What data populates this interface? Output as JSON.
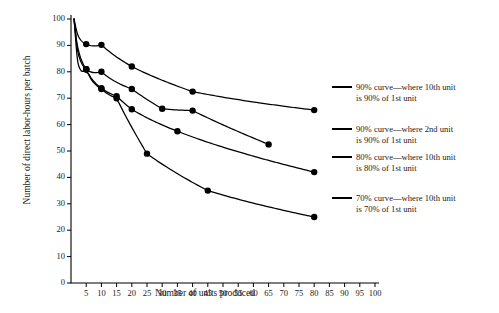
{
  "chart_data": {
    "type": "line",
    "title": "",
    "xlabel": "Number of units produced",
    "ylabel": "Number of direct labor-hours per batch",
    "xlim": [
      0,
      100
    ],
    "ylim": [
      0,
      100
    ],
    "grid": false,
    "legend_position": "right",
    "x_ticks": [
      5,
      10,
      15,
      20,
      25,
      30,
      35,
      40,
      45,
      50,
      55,
      60,
      65,
      70,
      75,
      80,
      85,
      90,
      95,
      100
    ],
    "y_ticks": [
      0,
      10,
      20,
      30,
      40,
      50,
      60,
      70,
      80,
      90,
      100
    ],
    "series": [
      {
        "name": "90% curve—where 10th unit is 90% of 1st unit",
        "legend_line1": "90% curve—where 10th unit",
        "legend_line2": "is 90% of 1st unit",
        "marker": "filled-circle",
        "x": [
          1,
          5,
          10,
          20,
          40,
          80
        ],
        "y": [
          100,
          90.5,
          90.2,
          82,
          72.5,
          65.5
        ]
      },
      {
        "name": "90% curve—where 2nd unit is 90% of 1st unit",
        "legend_line1": "90% curve—where 2nd unit",
        "legend_line2": "is 90% of 1st unit",
        "marker": "filled-circle",
        "x": [
          1,
          5,
          10,
          20,
          30,
          40,
          65
        ],
        "y": [
          100,
          81,
          80,
          73.5,
          66,
          65.3,
          52.5
        ]
      },
      {
        "name": "80% curve—where 10th unit is 80% of 1st unit",
        "legend_line1": "80% curve—where 10th unit",
        "legend_line2": "is 80% of 1st unit",
        "marker": "filled-circle",
        "x": [
          1,
          5,
          10,
          15,
          20,
          35,
          80
        ],
        "y": [
          100,
          81,
          73.8,
          70.8,
          65.8,
          57.5,
          42
        ]
      },
      {
        "name": "70% curve—where 10th unit is 70% of 1st unit",
        "legend_line1": "70% curve—where 10th unit",
        "legend_line2": "is 70% of 1st unit",
        "marker": "filled-circle",
        "x": [
          1,
          5,
          10,
          15,
          25,
          45,
          80
        ],
        "y": [
          100,
          81,
          73.5,
          70,
          49,
          35,
          25
        ]
      }
    ]
  },
  "axes": {
    "x_title": "Number of units produced",
    "y_title": "Number of direct labor-hours per batch"
  }
}
